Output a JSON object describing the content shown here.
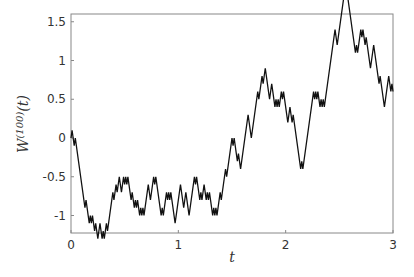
{
  "chart_data": {
    "type": "line",
    "title": "",
    "xlabel": "t",
    "ylabel": "W^(100)(t)",
    "xlim": [
      0,
      3
    ],
    "ylim": [
      -1.2,
      1.55
    ],
    "xticks": [
      0,
      1,
      2,
      3
    ],
    "xtick_labels": [
      "0",
      "1",
      "2",
      "3"
    ],
    "yticks": [
      -1,
      -0.5,
      0,
      0.5,
      1,
      1.5
    ],
    "ytick_labels": [
      "-1",
      "-0.5",
      "0",
      "0.5",
      "1",
      "1.5"
    ],
    "grid": false,
    "legend": null,
    "step_size": 0.1,
    "dt": 0.01,
    "series": [
      {
        "name": "W^(100)(t)",
        "description": "scaled random walk, key waypoints (t, W)",
        "x": [
          0,
          0.3,
          0.55,
          0.68,
          0.8,
          0.9,
          0.97,
          1.07,
          1.25,
          1.4,
          1.55,
          1.65,
          1.75,
          1.83,
          1.95,
          2.05,
          2.13,
          2.3,
          2.45,
          2.5,
          2.65,
          2.75,
          2.85,
          2.93,
          2.97,
          3.0
        ],
        "values": [
          0,
          -1.1,
          -0.6,
          -0.9,
          -0.6,
          -0.8,
          -1.1,
          -0.7,
          -0.7,
          -0.8,
          -0.2,
          0.3,
          0.6,
          0.8,
          0.6,
          0.3,
          -0.2,
          0.7,
          1.3,
          1.4,
          1.1,
          1.3,
          0.9,
          0.4,
          0.7,
          0.5
        ]
      }
    ]
  },
  "axes": {
    "x_label_main": "t",
    "y_label_main": "W",
    "y_label_sup": "(100)",
    "y_label_arg": "(t)"
  }
}
